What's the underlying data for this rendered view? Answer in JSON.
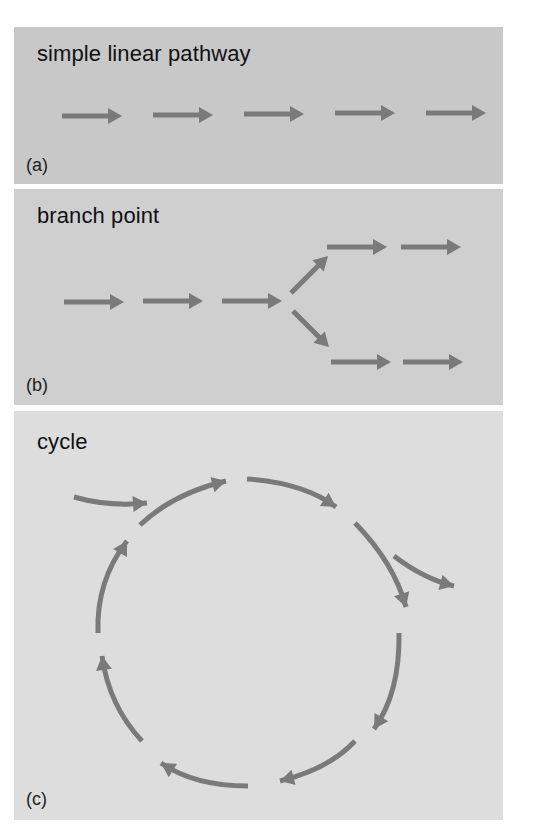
{
  "colors": {
    "arrow": "#7a7a7a",
    "panel_a_bg": "#c8c8c8",
    "panel_b_bg": "#cfcfcf",
    "panel_c_bg": "#dddddd"
  },
  "panels": [
    {
      "id": "a",
      "title": "simple linear pathway",
      "label": "(a)",
      "arrows": [
        {
          "type": "straight",
          "x1": 48,
          "y1": 89,
          "x2": 108,
          "y2": 89
        },
        {
          "type": "straight",
          "x1": 139,
          "y1": 88,
          "x2": 199,
          "y2": 88
        },
        {
          "type": "straight",
          "x1": 230,
          "y1": 87,
          "x2": 290,
          "y2": 87
        },
        {
          "type": "straight",
          "x1": 321,
          "y1": 86,
          "x2": 381,
          "y2": 86
        },
        {
          "type": "straight",
          "x1": 412,
          "y1": 86,
          "x2": 472,
          "y2": 86
        }
      ]
    },
    {
      "id": "b",
      "title": "branch point",
      "label": "(b)",
      "arrows": [
        {
          "type": "straight",
          "x1": 50,
          "y1": 113,
          "x2": 110,
          "y2": 113
        },
        {
          "type": "straight",
          "x1": 129,
          "y1": 112,
          "x2": 189,
          "y2": 112
        },
        {
          "type": "straight",
          "x1": 208,
          "y1": 112,
          "x2": 268,
          "y2": 112
        },
        {
          "type": "straight",
          "x1": 277,
          "y1": 104,
          "x2": 314,
          "y2": 67
        },
        {
          "type": "straight",
          "x1": 279,
          "y1": 122,
          "x2": 315,
          "y2": 158
        },
        {
          "type": "straight",
          "x1": 313,
          "y1": 58,
          "x2": 373,
          "y2": 58
        },
        {
          "type": "straight",
          "x1": 387,
          "y1": 58,
          "x2": 447,
          "y2": 58
        },
        {
          "type": "straight",
          "x1": 317,
          "y1": 173,
          "x2": 377,
          "y2": 173
        },
        {
          "type": "straight",
          "x1": 389,
          "y1": 173,
          "x2": 449,
          "y2": 173
        }
      ]
    },
    {
      "id": "c",
      "title": "cycle",
      "label": "(c)",
      "arrows": [
        {
          "type": "curve",
          "d": "M 60 86 Q 95 96 133 92",
          "tip": [
            133,
            92
          ],
          "angle": -4
        },
        {
          "type": "curve",
          "d": "M 126 114 Q 160 82 212 70",
          "tip": [
            212,
            70
          ],
          "angle": -15
        },
        {
          "type": "curve",
          "d": "M 233 68 Q 290 72 322 96",
          "tip": [
            322,
            96
          ],
          "angle": 33
        },
        {
          "type": "curve",
          "d": "M 341 112 Q 380 152 392 196",
          "tip": [
            392,
            196
          ],
          "angle": 72
        },
        {
          "type": "curve",
          "d": "M 380 145 Q 410 168 440 175",
          "tip": [
            440,
            175
          ],
          "angle": 15
        },
        {
          "type": "curve",
          "d": "M 385 222 Q 386 282 360 318",
          "tip": [
            360,
            318
          ],
          "angle": 122
        },
        {
          "type": "curve",
          "d": "M 341 330 Q 315 358 266 370",
          "tip": [
            266,
            370
          ],
          "angle": 165
        },
        {
          "type": "curve",
          "d": "M 234 375 Q 180 375 147 352",
          "tip": [
            147,
            352
          ],
          "angle": 212
        },
        {
          "type": "curve",
          "d": "M 128 330 Q 95 295 88 245",
          "tip": [
            88,
            245
          ],
          "angle": 262
        },
        {
          "type": "curve",
          "d": "M 84 222 Q 82 170 113 130",
          "tip": [
            113,
            130
          ],
          "angle": 300
        }
      ]
    }
  ]
}
